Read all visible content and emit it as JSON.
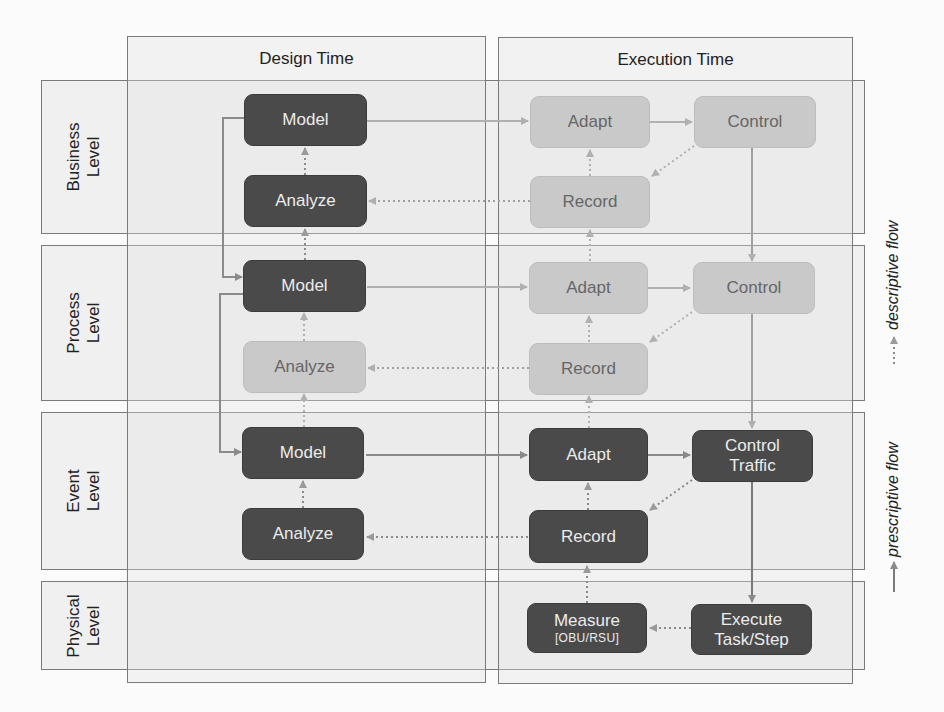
{
  "columns": {
    "design": {
      "title": "Design Time"
    },
    "execution": {
      "title": "Execution Time"
    }
  },
  "levels": [
    {
      "id": "business",
      "label": "Business\nLevel"
    },
    {
      "id": "process",
      "label": "Process\nLevel"
    },
    {
      "id": "event",
      "label": "Event\nLevel"
    },
    {
      "id": "physical",
      "label": "Physical\nLevel"
    }
  ],
  "boxes": {
    "business_model": {
      "label": "Model",
      "style": "dark"
    },
    "business_analyze": {
      "label": "Analyze",
      "style": "dark"
    },
    "business_adapt": {
      "label": "Adapt",
      "style": "light"
    },
    "business_control": {
      "label": "Control",
      "style": "light"
    },
    "business_record": {
      "label": "Record",
      "style": "light"
    },
    "process_model": {
      "label": "Model",
      "style": "dark"
    },
    "process_analyze": {
      "label": "Analyze",
      "style": "light"
    },
    "process_adapt": {
      "label": "Adapt",
      "style": "light"
    },
    "process_control": {
      "label": "Control",
      "style": "light"
    },
    "process_record": {
      "label": "Record",
      "style": "light"
    },
    "event_model": {
      "label": "Model",
      "style": "dark"
    },
    "event_analyze": {
      "label": "Analyze",
      "style": "dark"
    },
    "event_adapt": {
      "label": "Adapt",
      "style": "dark"
    },
    "event_control": {
      "label": "Control",
      "label2": "Traffic",
      "style": "dark"
    },
    "event_record": {
      "label": "Record",
      "style": "dark"
    },
    "physical_measure": {
      "label": "Measure",
      "sub": "[OBU/RSU]",
      "style": "dark"
    },
    "physical_execute": {
      "label": "Execute",
      "label2": "Task/Step",
      "style": "dark"
    }
  },
  "legend": {
    "descriptive": "descriptive flow",
    "prescriptive": "prescriptive flow"
  },
  "colors": {
    "dark_box": "#4a4a4a",
    "light_box": "#c9c9c9",
    "prescriptive_arrow": "#888888",
    "descriptive_arrow": "#9a9a9a",
    "frame_border": "#7a7a7a"
  }
}
